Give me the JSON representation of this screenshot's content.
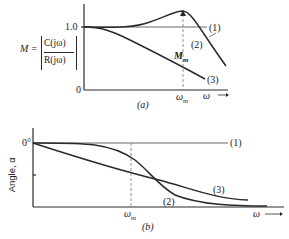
{
  "figure_a": {
    "caption": "(a)",
    "ylabel_M": "M =",
    "ylabel_num": "C(jω)",
    "ylabel_den": "R(jω)",
    "ytick_top": "1.0",
    "ytick_bottom": "0",
    "xtick_wm": "ω",
    "xtick_wm_sub": "m",
    "xaxis_label": "ω ⟶",
    "peak_label": "M",
    "peak_label_sub": "m",
    "curve_labels": [
      "(1)",
      "(2)",
      "(3)"
    ]
  },
  "figure_b": {
    "caption": "(b)",
    "ylabel": "Angle, α",
    "ytick_top": "0°",
    "xtick_wm": "ω",
    "xtick_wm_sub": "m",
    "xaxis_label": "ω ⟶",
    "curve_labels": [
      "(1)",
      "(2)",
      "(3)"
    ]
  },
  "colors": {
    "line": "#2a2a2a",
    "dashed": "#777777"
  }
}
